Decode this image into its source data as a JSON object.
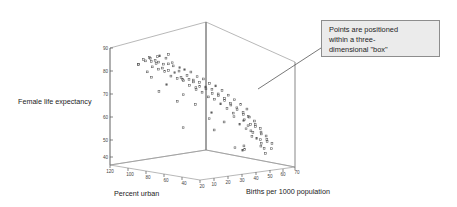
{
  "chart_data": {
    "type": "scatter",
    "title": "",
    "projection": "3d",
    "xlabel": "Births per 1000 population",
    "ylabel": "Percent urban",
    "zlabel": "Female life expectancy",
    "x_ticks": [
      10,
      20,
      30,
      40,
      50,
      60,
      70
    ],
    "y_ticks": [
      120,
      100,
      80,
      60,
      40,
      20
    ],
    "z_ticks": [
      40,
      50,
      60,
      70,
      80,
      90
    ],
    "xlim": [
      5,
      70
    ],
    "ylim": [
      120,
      10
    ],
    "zlim": [
      35,
      90
    ],
    "grid": false,
    "legend": null,
    "marker": "open-square",
    "points": [
      {
        "x": 12,
        "y": 86,
        "z": 80
      },
      {
        "x": 13,
        "y": 92,
        "z": 79
      },
      {
        "x": 14,
        "y": 88,
        "z": 80
      },
      {
        "x": 13,
        "y": 78,
        "z": 80
      },
      {
        "x": 15,
        "y": 84,
        "z": 79
      },
      {
        "x": 12,
        "y": 74,
        "z": 80
      },
      {
        "x": 14,
        "y": 96,
        "z": 80
      },
      {
        "x": 16,
        "y": 90,
        "z": 79
      },
      {
        "x": 13,
        "y": 100,
        "z": 78
      },
      {
        "x": 15,
        "y": 80,
        "z": 78
      },
      {
        "x": 17,
        "y": 86,
        "z": 78
      },
      {
        "x": 16,
        "y": 76,
        "z": 77
      },
      {
        "x": 14,
        "y": 70,
        "z": 79
      },
      {
        "x": 18,
        "y": 92,
        "z": 77
      },
      {
        "x": 12,
        "y": 64,
        "z": 80
      },
      {
        "x": 19,
        "y": 82,
        "z": 76
      },
      {
        "x": 17,
        "y": 72,
        "z": 77
      },
      {
        "x": 20,
        "y": 88,
        "z": 76
      },
      {
        "x": 16,
        "y": 66,
        "z": 77
      },
      {
        "x": 21,
        "y": 78,
        "z": 75
      },
      {
        "x": 18,
        "y": 68,
        "z": 76
      },
      {
        "x": 22,
        "y": 84,
        "z": 75
      },
      {
        "x": 19,
        "y": 62,
        "z": 75
      },
      {
        "x": 23,
        "y": 74,
        "z": 74
      },
      {
        "x": 20,
        "y": 58,
        "z": 74
      },
      {
        "x": 24,
        "y": 80,
        "z": 73
      },
      {
        "x": 21,
        "y": 66,
        "z": 74
      },
      {
        "x": 25,
        "y": 70,
        "z": 72
      },
      {
        "x": 22,
        "y": 54,
        "z": 73
      },
      {
        "x": 26,
        "y": 76,
        "z": 72
      },
      {
        "x": 23,
        "y": 60,
        "z": 72
      },
      {
        "x": 27,
        "y": 64,
        "z": 71
      },
      {
        "x": 24,
        "y": 50,
        "z": 71
      },
      {
        "x": 28,
        "y": 72,
        "z": 71
      },
      {
        "x": 25,
        "y": 56,
        "z": 70
      },
      {
        "x": 29,
        "y": 62,
        "z": 70
      },
      {
        "x": 26,
        "y": 46,
        "z": 70
      },
      {
        "x": 30,
        "y": 68,
        "z": 69
      },
      {
        "x": 27,
        "y": 52,
        "z": 69
      },
      {
        "x": 31,
        "y": 58,
        "z": 68
      },
      {
        "x": 28,
        "y": 42,
        "z": 68
      },
      {
        "x": 32,
        "y": 64,
        "z": 68
      },
      {
        "x": 29,
        "y": 48,
        "z": 67
      },
      {
        "x": 33,
        "y": 54,
        "z": 67
      },
      {
        "x": 30,
        "y": 38,
        "z": 67
      },
      {
        "x": 34,
        "y": 60,
        "z": 66
      },
      {
        "x": 31,
        "y": 44,
        "z": 66
      },
      {
        "x": 35,
        "y": 50,
        "z": 65
      },
      {
        "x": 32,
        "y": 34,
        "z": 65
      },
      {
        "x": 36,
        "y": 56,
        "z": 64
      },
      {
        "x": 33,
        "y": 40,
        "z": 64
      },
      {
        "x": 37,
        "y": 46,
        "z": 64
      },
      {
        "x": 34,
        "y": 30,
        "z": 63
      },
      {
        "x": 38,
        "y": 52,
        "z": 63
      },
      {
        "x": 35,
        "y": 36,
        "z": 62
      },
      {
        "x": 39,
        "y": 42,
        "z": 62
      },
      {
        "x": 36,
        "y": 26,
        "z": 61
      },
      {
        "x": 40,
        "y": 48,
        "z": 61
      },
      {
        "x": 37,
        "y": 32,
        "z": 60
      },
      {
        "x": 41,
        "y": 38,
        "z": 60
      },
      {
        "x": 38,
        "y": 22,
        "z": 59
      },
      {
        "x": 42,
        "y": 44,
        "z": 59
      },
      {
        "x": 39,
        "y": 28,
        "z": 58
      },
      {
        "x": 43,
        "y": 34,
        "z": 58
      },
      {
        "x": 40,
        "y": 18,
        "z": 57
      },
      {
        "x": 44,
        "y": 40,
        "z": 57
      },
      {
        "x": 41,
        "y": 24,
        "z": 56
      },
      {
        "x": 45,
        "y": 30,
        "z": 56
      },
      {
        "x": 42,
        "y": 36,
        "z": 55
      },
      {
        "x": 46,
        "y": 26,
        "z": 55
      },
      {
        "x": 43,
        "y": 20,
        "z": 54
      },
      {
        "x": 47,
        "y": 32,
        "z": 54
      },
      {
        "x": 44,
        "y": 28,
        "z": 53
      },
      {
        "x": 48,
        "y": 22,
        "z": 53
      },
      {
        "x": 45,
        "y": 34,
        "z": 52
      },
      {
        "x": 49,
        "y": 28,
        "z": 52
      },
      {
        "x": 46,
        "y": 18,
        "z": 51
      },
      {
        "x": 50,
        "y": 24,
        "z": 51
      },
      {
        "x": 47,
        "y": 30,
        "z": 50
      },
      {
        "x": 51,
        "y": 20,
        "z": 50
      },
      {
        "x": 48,
        "y": 26,
        "z": 49
      },
      {
        "x": 52,
        "y": 30,
        "z": 49
      },
      {
        "x": 49,
        "y": 16,
        "z": 48
      },
      {
        "x": 53,
        "y": 22,
        "z": 48
      },
      {
        "x": 50,
        "y": 28,
        "z": 47
      },
      {
        "x": 54,
        "y": 18,
        "z": 47
      },
      {
        "x": 51,
        "y": 24,
        "z": 46
      },
      {
        "x": 55,
        "y": 26,
        "z": 46
      },
      {
        "x": 52,
        "y": 14,
        "z": 45
      },
      {
        "x": 56,
        "y": 20,
        "z": 45
      },
      {
        "x": 53,
        "y": 22,
        "z": 44
      },
      {
        "x": 57,
        "y": 16,
        "z": 44
      },
      {
        "x": 48,
        "y": 34,
        "z": 43
      },
      {
        "x": 54,
        "y": 24,
        "z": 43
      },
      {
        "x": 44,
        "y": 38,
        "z": 42
      },
      {
        "x": 58,
        "y": 18,
        "z": 42
      },
      {
        "x": 46,
        "y": 30,
        "z": 41
      },
      {
        "x": 50,
        "y": 14,
        "z": 41
      },
      {
        "x": 42,
        "y": 26,
        "z": 40
      },
      {
        "x": 56,
        "y": 22,
        "z": 40
      },
      {
        "x": 39,
        "y": 54,
        "z": 50
      },
      {
        "x": 24,
        "y": 66,
        "z": 50
      },
      {
        "x": 30,
        "y": 76,
        "z": 72
      },
      {
        "x": 36,
        "y": 70,
        "z": 68
      },
      {
        "x": 20,
        "y": 96,
        "z": 73
      },
      {
        "x": 26,
        "y": 88,
        "z": 70
      },
      {
        "x": 33,
        "y": 80,
        "z": 66
      },
      {
        "x": 41,
        "y": 60,
        "z": 58
      },
      {
        "x": 45,
        "y": 52,
        "z": 54
      },
      {
        "x": 51,
        "y": 34,
        "z": 52
      },
      {
        "x": 28,
        "y": 100,
        "z": 68
      },
      {
        "x": 22,
        "y": 104,
        "z": 76
      },
      {
        "x": 18,
        "y": 108,
        "z": 79
      },
      {
        "x": 35,
        "y": 90,
        "z": 64
      },
      {
        "x": 43,
        "y": 66,
        "z": 56
      },
      {
        "x": 38,
        "y": 74,
        "z": 62
      }
    ]
  },
  "axes": {
    "z_label": "Female life expectancy",
    "y_label": "Percent urban",
    "x_label": "Births per 1000 population",
    "z_tick_labels": [
      "90",
      "80",
      "70",
      "60",
      "50",
      "40"
    ],
    "y_tick_labels": [
      "120",
      "100",
      "80",
      "60",
      "40",
      "20"
    ],
    "x_tick_labels": [
      "10",
      "20",
      "30",
      "40",
      "50",
      "60",
      "70"
    ]
  },
  "annotation": {
    "text": "Points are positioned\nwithin a three-\ndimensional \"box\"",
    "fill_color": "#ebebeb",
    "border_color": "#8d8d8d"
  },
  "colors": {
    "background": "#ffffff",
    "box_wire": "#9a9a9a",
    "marker": "#555555",
    "text": "#1d1d1d"
  }
}
